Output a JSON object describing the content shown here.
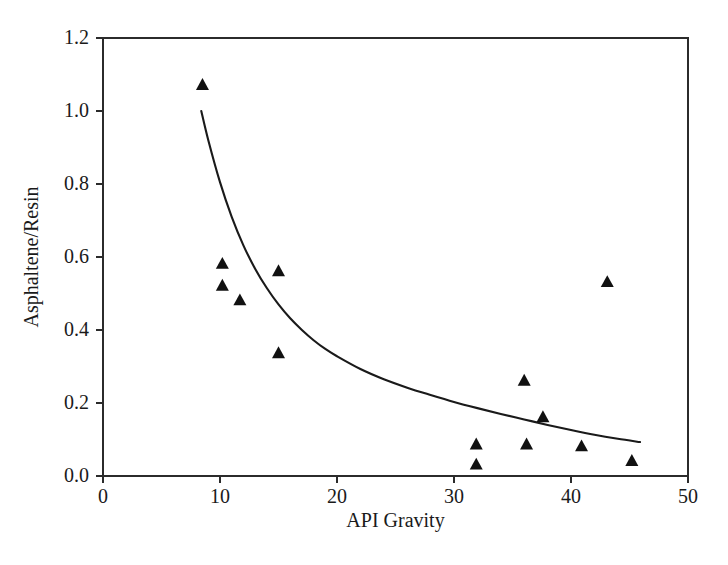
{
  "chart_data": {
    "type": "scatter",
    "title": "",
    "xlabel": "API Gravity",
    "ylabel": "Asphaltene/Resin",
    "xlim": [
      0,
      50
    ],
    "ylim": [
      0.0,
      1.2
    ],
    "xticks": [
      0,
      10,
      20,
      30,
      40,
      50
    ],
    "xtick_labels": [
      "0",
      "10",
      "20",
      "30",
      "40",
      "50"
    ],
    "yticks": [
      0.0,
      0.2,
      0.4,
      0.6,
      0.8,
      1.0,
      1.2
    ],
    "ytick_labels": [
      "0.0",
      "0.2",
      "0.4",
      "0.6",
      "0.8",
      "1.0",
      "1.2"
    ],
    "grid": false,
    "legend": false,
    "legend_position": "none",
    "marker": "triangle-up",
    "marker_color": "#111111",
    "line_color": "#1a1a1a",
    "series": [
      {
        "name": "Measured data",
        "type": "scatter",
        "points": [
          {
            "x": 8.5,
            "y": 1.07
          },
          {
            "x": 10.2,
            "y": 0.58
          },
          {
            "x": 10.2,
            "y": 0.52
          },
          {
            "x": 11.7,
            "y": 0.48
          },
          {
            "x": 15.0,
            "y": 0.56
          },
          {
            "x": 15.0,
            "y": 0.335
          },
          {
            "x": 31.9,
            "y": 0.085
          },
          {
            "x": 31.9,
            "y": 0.03
          },
          {
            "x": 36.0,
            "y": 0.26
          },
          {
            "x": 36.2,
            "y": 0.085
          },
          {
            "x": 37.6,
            "y": 0.16
          },
          {
            "x": 40.9,
            "y": 0.08
          },
          {
            "x": 43.1,
            "y": 0.53
          },
          {
            "x": 45.2,
            "y": 0.04
          }
        ]
      },
      {
        "name": "Fitted trend",
        "type": "line",
        "points": [
          {
            "x": 8.4,
            "y": 1.0
          },
          {
            "x": 9.0,
            "y": 0.92
          },
          {
            "x": 10.0,
            "y": 0.805
          },
          {
            "x": 11.0,
            "y": 0.71
          },
          {
            "x": 12.0,
            "y": 0.632
          },
          {
            "x": 13.0,
            "y": 0.568
          },
          {
            "x": 14.0,
            "y": 0.515
          },
          {
            "x": 15.0,
            "y": 0.47
          },
          {
            "x": 16.0,
            "y": 0.432
          },
          {
            "x": 17.0,
            "y": 0.4
          },
          {
            "x": 18.0,
            "y": 0.372
          },
          {
            "x": 19.0,
            "y": 0.348
          },
          {
            "x": 20.0,
            "y": 0.328
          },
          {
            "x": 22.0,
            "y": 0.293
          },
          {
            "x": 24.0,
            "y": 0.265
          },
          {
            "x": 26.0,
            "y": 0.242
          },
          {
            "x": 28.0,
            "y": 0.222
          },
          {
            "x": 30.0,
            "y": 0.203
          },
          {
            "x": 32.0,
            "y": 0.186
          },
          {
            "x": 34.0,
            "y": 0.17
          },
          {
            "x": 36.0,
            "y": 0.155
          },
          {
            "x": 38.0,
            "y": 0.14
          },
          {
            "x": 40.0,
            "y": 0.126
          },
          {
            "x": 42.0,
            "y": 0.113
          },
          {
            "x": 44.0,
            "y": 0.102
          },
          {
            "x": 45.9,
            "y": 0.093
          }
        ]
      }
    ]
  },
  "plot_geometry": {
    "left": 103,
    "right": 688,
    "top": 38,
    "bottom": 476,
    "marker_size": 13,
    "xlabel_y": 527,
    "ylabel_x": 38
  }
}
